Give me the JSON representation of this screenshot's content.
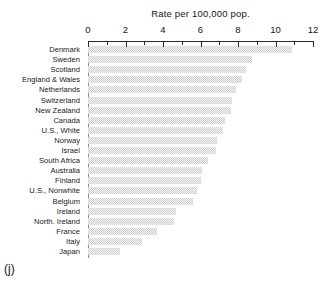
{
  "figure": {
    "panel_tag": "(j)"
  },
  "chart_data": {
    "type": "bar",
    "orientation": "horizontal",
    "title": "Rate per 100,000 pop.",
    "xlabel": "",
    "ylabel": "",
    "xlim": [
      0,
      12
    ],
    "grid": false,
    "legend": null,
    "x_major_ticks": [
      0,
      2,
      4,
      6,
      8,
      10,
      12
    ],
    "x_minor_ticks": [
      1,
      3,
      5,
      7,
      9,
      11
    ],
    "x_tick_labels": [
      "0",
      "2",
      "4",
      "6",
      "8",
      "10",
      "12"
    ],
    "bar_color": "#cfcfcf",
    "categories": [
      "Denmark",
      "Sweden",
      "Scotland",
      "England & Wales",
      "Netherlands",
      "Switzerland",
      "New Zealand",
      "Canada",
      "U.S., White",
      "Norway",
      "Israel",
      "South Africa",
      "Australia",
      "Finland",
      "U.S., Nonwhite",
      "Belgium",
      "Ireland",
      "North. Ireland",
      "France",
      "Italy",
      "Japan"
    ],
    "values": [
      10.9,
      8.75,
      8.4,
      8.2,
      7.9,
      7.7,
      7.6,
      7.3,
      7.2,
      6.9,
      6.8,
      6.4,
      6.1,
      6.0,
      5.8,
      5.6,
      4.7,
      4.6,
      3.7,
      2.9,
      1.7
    ]
  }
}
